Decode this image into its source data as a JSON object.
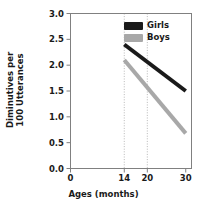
{
  "chart_data": {
    "type": "line",
    "title": "",
    "xlabel": "Ages (months)",
    "ylabel_line1": "Diminutives per",
    "ylabel_line2": "100 Utterances",
    "ylabel": "Diminutives per 100 Utterances",
    "x": [
      14,
      30
    ],
    "xlim": [
      0,
      31.5
    ],
    "ylim": [
      0.0,
      3.0
    ],
    "xticks": [
      0,
      14,
      20,
      30
    ],
    "xtick_labels": [
      "0",
      "14",
      "20",
      "30"
    ],
    "yticks": [
      0.0,
      0.5,
      1.0,
      1.5,
      2.0,
      2.5,
      3.0
    ],
    "ytick_labels": [
      "0.0",
      "0.5",
      "1.0",
      "1.5",
      "2.0",
      "2.5",
      "3.0"
    ],
    "grid": "vertical-dotted-at-14-and-20",
    "gridlines_x": [
      14,
      20
    ],
    "legend_position": "top-right-inside",
    "series": [
      {
        "name": "Girls",
        "color": "#1a1a1a",
        "values": [
          2.4,
          1.5
        ]
      },
      {
        "name": "Boys",
        "color": "#a8a8a8",
        "values": [
          2.1,
          0.68
        ]
      }
    ]
  },
  "legend": {
    "items": [
      {
        "label": "Girls",
        "color": "#1a1a1a"
      },
      {
        "label": "Boys",
        "color": "#a8a8a8"
      }
    ]
  },
  "axes": {
    "frame_color": "#808080",
    "tick_color": "#808080",
    "gridline_color": "#b0b0b0",
    "text_color": "#1a1a1a"
  }
}
